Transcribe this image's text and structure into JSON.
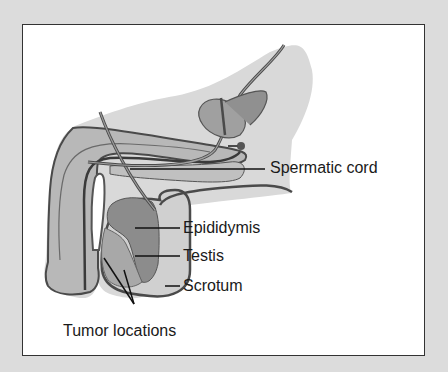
{
  "figure": {
    "labels": {
      "spermatic_cord": "Spermatic cord",
      "epididymis": "Epididymis",
      "testis": "Testis",
      "scrotum": "Scrotum",
      "tumor_locations": "Tumor locations"
    },
    "colors": {
      "background": "#dcdcdc",
      "panel": "#ffffff",
      "body_fill": "#d9d9d9",
      "tissue_fill": "#b8b8b8",
      "epididymis_fill": "#8c8c8c",
      "testis_fill": "#a8a8a8",
      "outline": "#4a4a4a",
      "leader_line": "#111111"
    }
  }
}
